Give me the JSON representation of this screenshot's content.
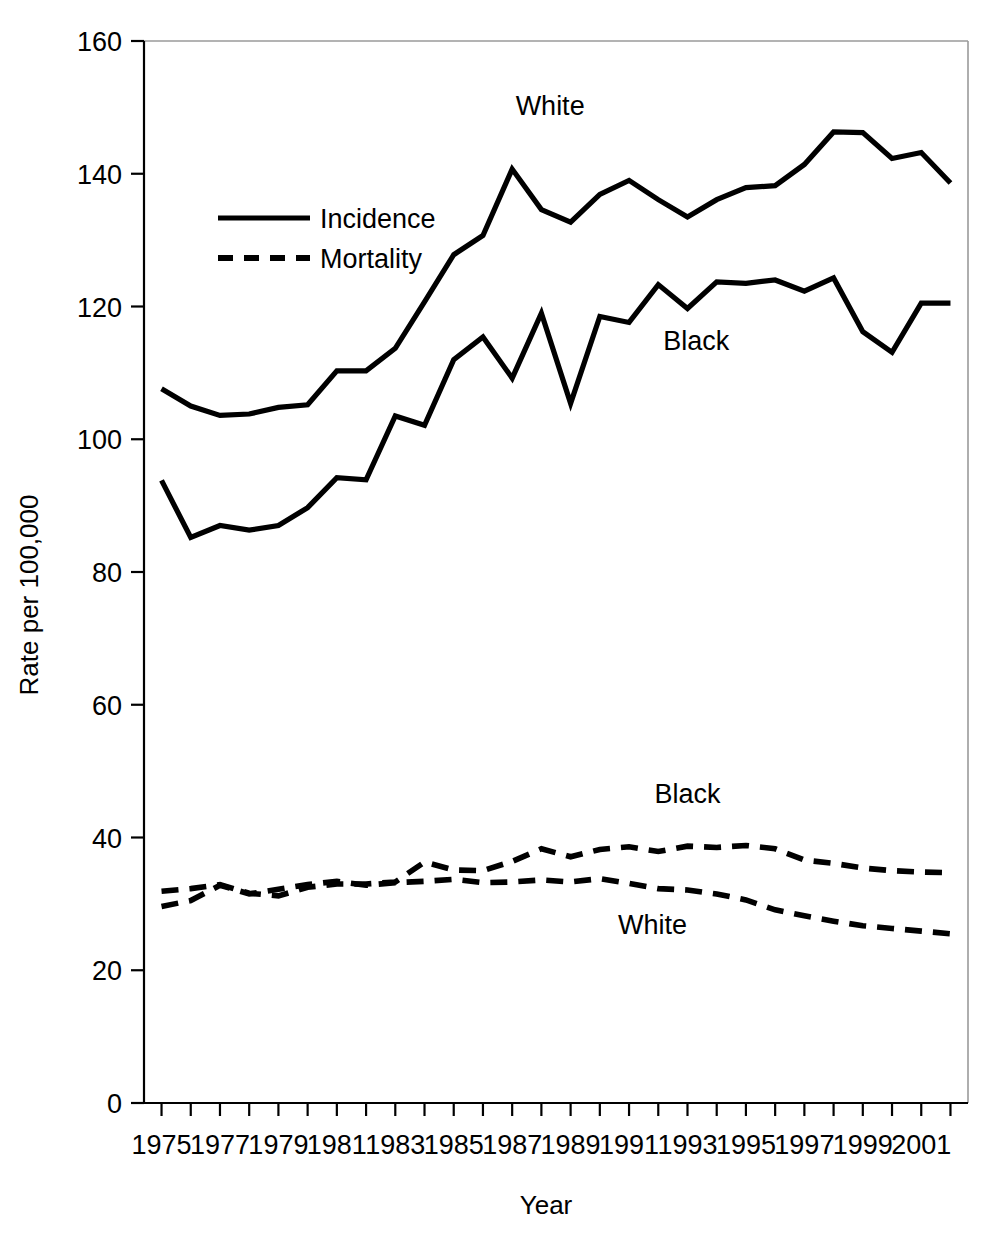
{
  "chart_data": {
    "type": "line",
    "title": "",
    "xlabel": "Year",
    "ylabel": "Rate per 100,000",
    "xlim": [
      1974.4,
      2002.6
    ],
    "ylim": [
      0,
      160
    ],
    "yticks": [
      0,
      20,
      40,
      60,
      80,
      100,
      120,
      140,
      160
    ],
    "ytick_labels": [
      "0",
      "20",
      "40",
      "60",
      "80",
      "100",
      "120",
      "140",
      "160"
    ],
    "xticks": [
      1975,
      1977,
      1979,
      1981,
      1983,
      1985,
      1987,
      1989,
      1991,
      1993,
      1995,
      1997,
      1999,
      2001
    ],
    "xtick_labels": [
      "1975",
      "1977",
      "1979",
      "1981",
      "1983",
      "1985",
      "1987",
      "1989",
      "1991",
      "1993",
      "1995",
      "1997",
      "1999",
      "2001"
    ],
    "x": [
      1975,
      1976,
      1977,
      1978,
      1979,
      1980,
      1981,
      1982,
      1983,
      1984,
      1985,
      1986,
      1987,
      1988,
      1989,
      1990,
      1991,
      1992,
      1993,
      1994,
      1995,
      1996,
      1997,
      1998,
      1999,
      2000,
      2001,
      2002
    ],
    "grid": false,
    "legend_position": "upper-left-inside",
    "series": [
      {
        "name": "White Incidence",
        "race": "White",
        "measure": "Incidence",
        "style": "solid",
        "color": "#000000",
        "annotation": "White",
        "values": [
          107.6,
          105.0,
          103.6,
          103.8,
          104.8,
          105.2,
          110.3,
          110.3,
          113.7,
          120.7,
          127.8,
          130.7,
          140.7,
          134.6,
          132.7,
          136.9,
          139.0,
          136.1,
          133.5,
          136.1,
          137.9,
          138.2,
          141.4,
          146.3,
          146.2,
          142.3,
          143.2,
          138.6
        ]
      },
      {
        "name": "Black Incidence",
        "race": "Black",
        "measure": "Incidence",
        "style": "solid",
        "color": "#000000",
        "annotation": "Black",
        "values": [
          93.8,
          85.2,
          87.0,
          86.3,
          87.0,
          89.7,
          94.2,
          93.9,
          103.5,
          102.1,
          112.0,
          115.4,
          109.2,
          119.0,
          105.4,
          118.5,
          117.6,
          123.3,
          119.7,
          123.7,
          123.5,
          124.0,
          122.3,
          124.3,
          116.2,
          113.1,
          120.5,
          120.5
        ]
      },
      {
        "name": "Black Mortality",
        "race": "Black",
        "measure": "Mortality",
        "style": "dashed",
        "color": "#000000",
        "annotation": "Black",
        "values": [
          31.9,
          32.3,
          32.9,
          31.6,
          31.2,
          32.5,
          33.0,
          33.0,
          33.3,
          36.3,
          35.1,
          35.0,
          36.4,
          38.3,
          37.1,
          38.2,
          38.6,
          37.9,
          38.7,
          38.5,
          38.8,
          38.3,
          36.6,
          36.1,
          35.4,
          35.0,
          34.8,
          34.7
        ]
      },
      {
        "name": "White Mortality",
        "race": "White",
        "measure": "Mortality",
        "style": "dashed",
        "color": "#000000",
        "annotation": "White",
        "values": [
          29.6,
          30.5,
          32.8,
          31.5,
          32.2,
          32.9,
          33.4,
          32.8,
          33.2,
          33.4,
          33.7,
          33.2,
          33.3,
          33.6,
          33.3,
          33.8,
          33.1,
          32.3,
          32.1,
          31.5,
          30.6,
          29.1,
          28.2,
          27.4,
          26.7,
          26.3,
          25.9,
          25.5
        ]
      }
    ],
    "legend_entries": [
      {
        "label": "Incidence",
        "style": "solid"
      },
      {
        "label": "Mortality",
        "style": "dashed"
      }
    ],
    "annotations": [
      {
        "text": "White",
        "series": "White Incidence",
        "x": 1988.3,
        "y": 148.8
      },
      {
        "text": "Black",
        "series": "Black Incidence",
        "x": 1993.3,
        "y": 113.5
      },
      {
        "text": "Black",
        "series": "Black Mortality",
        "x": 1993.0,
        "y": 45.2
      },
      {
        "text": "White",
        "series": "White Mortality",
        "x": 1991.8,
        "y": 25.4
      }
    ]
  }
}
